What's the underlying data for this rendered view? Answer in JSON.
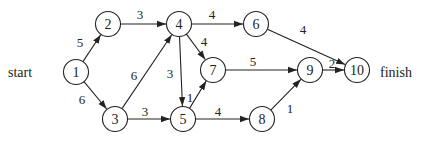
{
  "diagram": {
    "type": "directed-network",
    "start_label": "start",
    "finish_label": "finish",
    "nodes": [
      {
        "id": "1",
        "x": 76,
        "y": 72
      },
      {
        "id": "2",
        "x": 108,
        "y": 24
      },
      {
        "id": "3",
        "x": 115,
        "y": 119
      },
      {
        "id": "4",
        "x": 179,
        "y": 24
      },
      {
        "id": "5",
        "x": 183,
        "y": 119
      },
      {
        "id": "6",
        "x": 256,
        "y": 24
      },
      {
        "id": "7",
        "x": 213,
        "y": 70
      },
      {
        "id": "8",
        "x": 262,
        "y": 119
      },
      {
        "id": "9",
        "x": 310,
        "y": 70
      },
      {
        "id": "10",
        "x": 357,
        "y": 70
      }
    ],
    "edges": [
      {
        "from": "1",
        "to": "2",
        "weight": "5",
        "lx": 80,
        "ly": 47
      },
      {
        "from": "1",
        "to": "3",
        "weight": "6",
        "lx": 82,
        "ly": 104
      },
      {
        "from": "2",
        "to": "4",
        "weight": "3",
        "lx": 140,
        "ly": 19
      },
      {
        "from": "3",
        "to": "4",
        "weight": "6",
        "lx": 134,
        "ly": 80
      },
      {
        "from": "3",
        "to": "5",
        "weight": "3",
        "lx": 145,
        "ly": 116
      },
      {
        "from": "4",
        "to": "6",
        "weight": "4",
        "lx": 212,
        "ly": 19
      },
      {
        "from": "4",
        "to": "7",
        "weight": "4",
        "lx": 204,
        "ly": 46
      },
      {
        "from": "4",
        "to": "5",
        "weight": "3",
        "lx": 170,
        "ly": 78
      },
      {
        "from": "5",
        "to": "7",
        "weight": "1",
        "lx": 190,
        "ly": 102
      },
      {
        "from": "5",
        "to": "8",
        "weight": "4",
        "lx": 218,
        "ly": 116
      },
      {
        "from": "6",
        "to": "10",
        "weight": "4",
        "lx": 303,
        "ly": 34
      },
      {
        "from": "7",
        "to": "9",
        "weight": "5",
        "lx": 253,
        "ly": 66
      },
      {
        "from": "8",
        "to": "9",
        "weight": "1",
        "lx": 290,
        "ly": 113
      },
      {
        "from": "9",
        "to": "10",
        "weight": "2",
        "lx": 332,
        "ly": 68
      }
    ]
  }
}
